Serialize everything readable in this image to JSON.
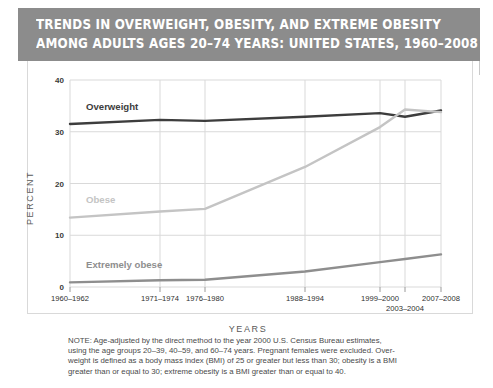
{
  "title": {
    "line1": "TRENDS IN OVERWEIGHT, OBESITY, AND EXTREME OBESITY",
    "line2": "AMONG ADULTS AGES 20–74 YEARS: UNITED STATES, 1960–2008"
  },
  "colors": {
    "title_bar": "#8c8c8c",
    "title_text": "#ffffff",
    "overweight": "#3d3d3d",
    "obese": "#c4c4c4",
    "extremely_obese": "#8e8e8e",
    "grid": "#d9d9d9",
    "axis_text": "#2f2f2f",
    "note_text": "#4a4a4a"
  },
  "note": {
    "line1": "NOTE: Age-adjusted by the direct method to the year 2000 U.S. Census Bureau estimates,",
    "line2": "using the age groups 20–39, 40–59, and 60–74 years. Pregnant females were excluded. Over-",
    "line3": "weight is defined as a body mass index (BMI) of 25 or greater but less than 30; obesity is a BMI",
    "line4": "greater than or equal to 30; extreme obesity is a BMI greater than or equal to 40."
  },
  "chart_data": {
    "type": "line",
    "title": "TRENDS IN OVERWEIGHT, OBESITY, AND EXTREME OBESITY AMONG ADULTS AGES 20–74 YEARS: UNITED STATES, 1960–2008",
    "xlabel": "YEARS",
    "ylabel": "PERCENT",
    "ylim": [
      0,
      40
    ],
    "yticks": [
      0,
      10,
      20,
      30,
      40
    ],
    "ytick_labels": [
      "0",
      "10",
      "20",
      "30",
      "40"
    ],
    "grid": true,
    "legend_position": "inline-labels",
    "categories": [
      "1960–1962",
      "1971–1974",
      "1976–1980",
      "1988–1994",
      "1999–2000",
      "2003–2004",
      "2007–2008"
    ],
    "category_offset_second_row": [
      "2003–2004"
    ],
    "series": [
      {
        "name": "Overweight",
        "color": "#3d3d3d",
        "values": [
          31.5,
          32.3,
          32.1,
          32.9,
          33.6,
          32.9,
          34.1
        ]
      },
      {
        "name": "Obese",
        "color": "#c4c4c4",
        "values": [
          13.4,
          14.6,
          15.1,
          23.2,
          30.9,
          34.3,
          33.8
        ]
      },
      {
        "name": "Extremely obese",
        "color": "#8e8e8e",
        "values": [
          0.9,
          1.3,
          1.4,
          3.0,
          4.8,
          5.4,
          6.3
        ]
      }
    ]
  }
}
